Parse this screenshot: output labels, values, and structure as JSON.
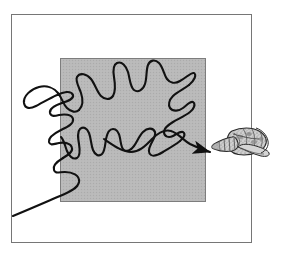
{
  "figure": {
    "title": "Random search path of a predator converging on a gastropod shell",
    "caption": "",
    "background_color": "#ffffff",
    "canvas": {
      "width": 282,
      "height": 260
    }
  },
  "frame": {
    "name": "outer-border-rectangle",
    "x": 11,
    "y": 14,
    "width": 241,
    "height": 229,
    "stroke_color": "#6f6f6f",
    "stroke_width": 1,
    "fill": "none"
  },
  "search_area": {
    "name": "shaded-search-square",
    "label": "",
    "x": 60,
    "y": 58,
    "width": 146,
    "height": 144,
    "fill_color": "#b9b9b9",
    "stroke_color": "#7d7d7d",
    "stroke_width": 1
  },
  "walk_path": {
    "name": "random-walk-trajectory",
    "stroke_color": "#111111",
    "stroke_width": 2.1,
    "fill": "none",
    "start_point": {
      "x": 13,
      "y": 216
    },
    "end_point": {
      "x": 214,
      "y": 152
    },
    "has_arrowhead": true,
    "arrowhead_color": "#111111",
    "loop_count": 1,
    "d": "M 13,216 C 30,209 46,202 60,196 C 70,192 78,188 79,182 C 80,175 72,172 65,172 C 59,172 55,174 54,170 C 52,165 58,161 63,158 C 68,155 73,152 72,148 C 71,143 64,142 59,143 C 54,144 50,146 49,142 C 48,137 55,133 61,130 C 67,127 74,124 73,119 C 72,114 64,114 59,115 C 55,116 51,117 50,113 C 49,108 56,105 62,103 C 68,101 74,99 73,95 C 71,90 63,92 57,95 C 50,98 42,103 36,106 C 30,109 25,109 24,103 C 23,96 31,89 39,87 C 47,85 54,88 58,93 C 62,98 63,104 67,108 C 71,112 76,113 79,110 C 83,106 83,99 81,93 C 79,87 75,81 77,77 C 80,72 87,74 91,79 C 95,84 97,92 101,96 C 105,100 110,100 113,96 C 116,91 115,83 114,77 C 113,71 113,65 117,63 C 122,61 126,66 128,72 C 130,79 130,87 134,90 C 138,93 143,90 145,84 C 147,78 146,70 148,65 C 150,60 155,59 159,63 C 163,67 164,75 167,79 C 170,83 175,84 180,81 C 186,78 191,72 194,73 C 197,75 194,81 189,85 C 184,89 177,92 173,96 C 169,100 168,105 170,108 C 173,112 179,111 183,108 C 187,105 190,101 193,102 C 196,104 194,109 190,112 C 185,116 178,119 173,122 C 168,125 164,128 164,132 C 164,137 169,138 173,136 C 177,134 180,131 183,132 C 186,134 184,138 180,141 C 175,145 168,149 163,152 C 158,155 154,157 151,155 C 148,153 149,148 151,144 C 153,140 156,136 155,132 C 153,127 147,128 143,132 C 139,136 137,142 134,146 C 131,150 127,152 124,150 C 121,148 121,143 120,138 C 119,133 117,129 113,129 C 109,129 107,134 106,139 C 105,145 105,151 102,154 C 99,157 95,155 93,150 C 91,145 91,138 89,133 C 87,128 83,126 80,129 C 77,132 78,138 79,144 C 80,150 80,156 77,158 C 73,160 69,156 67,151 C 65,146 64,140 61,137",
    "segments": [
      {
        "name": "tail-segment",
        "d": "M 13,216 C 30,209 46,202 60,196 C 70,192 78,188 79,182 C 80,175 72,172 65,172 C 59,172 55,174 54,170 C 52,165 58,161 63,158"
      },
      {
        "name": "lower-zigzag-segment",
        "d": "M 63,158 C 68,155 73,152 72,148 C 71,143 64,142 59,143 C 54,144 50,146 49,142 C 48,137 55,133 61,130 C 67,127 74,124 73,119 C 72,114 64,114 59,115 C 55,116 51,117 50,113 C 49,108 56,105 62,103"
      },
      {
        "name": "left-loop-segment",
        "d": "M 62,103 C 68,101 74,99 73,95 C 71,90 63,92 57,95 C 50,98 42,103 36,106 C 30,109 25,109 24,103 C 23,96 31,89 39,87 C 47,85 54,88 58,93 C 62,98 63,104 67,108 C 71,112 76,113 79,110"
      },
      {
        "name": "upper-oscillation-segment",
        "d": "M 79,110 C 83,106 83,99 81,93 C 79,87 75,81 77,77 C 80,72 87,74 91,79 C 95,84 97,92 101,96 C 105,100 110,100 113,96 C 116,91 115,83 114,77 C 113,71 113,65 117,63 C 122,61 126,66 128,72 C 130,79 130,87 134,90 C 138,93 143,90 145,84 C 147,78 146,70 148,65 C 150,60 155,59 159,63 C 163,67 164,75 167,79 C 170,83 175,84 180,81 C 186,78 191,72 194,73 C 197,75 194,81 189,85"
      },
      {
        "name": "mid-descending-segment",
        "d": "M 189,85 C 184,89 177,92 173,96 C 169,100 168,105 170,108 C 173,112 179,111 183,108 C 187,105 190,101 193,102 C 196,104 194,109 190,112 C 185,116 178,119 173,122 C 168,125 164,128 164,132 C 164,137 169,138 173,136 C 177,134 180,131 183,132 C 186,134 184,138 180,141"
      },
      {
        "name": "lower-left-spikes-segment",
        "d": "M 180,141 C 175,145 168,149 163,152 C 158,155 154,157 151,155 C 148,153 149,148 151,144 C 153,140 156,136 155,132 C 153,127 147,128 143,132 C 139,136 137,142 134,146 C 131,150 127,152 124,150 C 121,148 121,143 120,138 C 119,133 117,129 113,129 C 109,129 107,134 106,139 C 105,145 105,151 102,154 C 99,157 95,155 93,150 C 91,145 91,138 89,133 C 87,128 83,126 80,129 C 77,132 78,138 79,144 C 80,150 80,156 77,158 C 73,160 69,156 67,151 C 65,146 64,140 61,137"
      },
      {
        "name": "final-approach-to-target-segment",
        "d": "M 107,141 C 116,146 124,152 132,152 C 140,152 146,145 152,139 C 158,133 164,129 171,131 C 178,133 183,140 190,144 C 197,148 205,150 212,152"
      }
    ]
  },
  "target": {
    "name": "gastropod-shell-illustration",
    "label": "",
    "x": 211,
    "y": 126,
    "width": 58,
    "height": 34,
    "outline_color": "#2b2b2b",
    "fill_color": "#c6c6c6",
    "texture": "stippled-mottled",
    "orientation": "spire-pointing-left"
  },
  "legend": {
    "visible": false,
    "items": []
  }
}
